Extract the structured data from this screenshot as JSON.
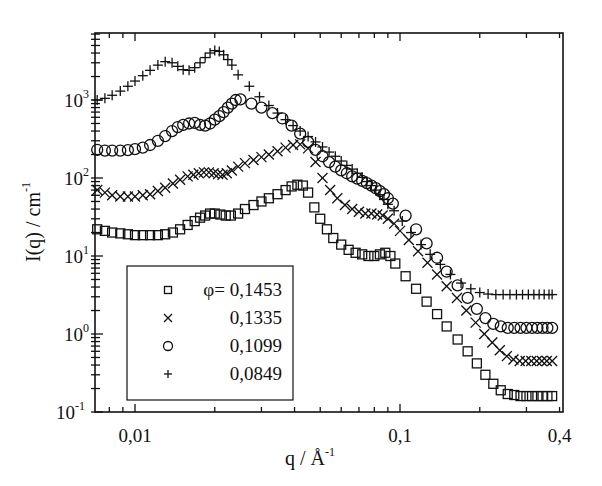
{
  "chart_data": {
    "type": "scatter",
    "title": "",
    "xlabel": "q / Å-1",
    "xlabel_parts": {
      "main": "q / Å",
      "sup": "-1"
    },
    "ylabel": "I(q) / cm-1",
    "ylabel_parts": {
      "main": "I(q) / cm",
      "sup": "-1"
    },
    "xscale": "log",
    "yscale": "log",
    "xlim": [
      0.0071,
      0.41
    ],
    "ylim": [
      0.1,
      6800
    ],
    "grid": false,
    "legend_position": "lower left (inside)",
    "x_ticks": [
      {
        "value": 0.01,
        "label": "0,01"
      },
      {
        "value": 0.1,
        "label": "0,1"
      },
      {
        "value": 0.4,
        "label": "0,4"
      }
    ],
    "y_ticks": [
      {
        "value": 0.1,
        "base": "10",
        "exp": "-1"
      },
      {
        "value": 1,
        "base": "10",
        "exp": "0"
      },
      {
        "value": 10,
        "base": "10",
        "exp": "1"
      },
      {
        "value": 100,
        "base": "10",
        "exp": "2"
      },
      {
        "value": 1000,
        "base": "10",
        "exp": "3"
      }
    ],
    "legend_title_prefix": "φ=",
    "series": [
      {
        "name": "0,1453",
        "marker": "square",
        "x": [
          0.0072,
          0.0077,
          0.0082,
          0.0088,
          0.0094,
          0.01,
          0.0107,
          0.0114,
          0.0122,
          0.013,
          0.0139,
          0.0148,
          0.0158,
          0.0168,
          0.0176,
          0.0184,
          0.0192,
          0.02,
          0.021,
          0.022,
          0.023,
          0.0245,
          0.026,
          0.028,
          0.03,
          0.032,
          0.0345,
          0.037,
          0.039,
          0.041,
          0.043,
          0.045,
          0.0475,
          0.05,
          0.053,
          0.056,
          0.06,
          0.064,
          0.068,
          0.072,
          0.076,
          0.08,
          0.084,
          0.088,
          0.092,
          0.096,
          0.105,
          0.115,
          0.126,
          0.138,
          0.15,
          0.165,
          0.18,
          0.195,
          0.21,
          0.225,
          0.24,
          0.255,
          0.27,
          0.285,
          0.3,
          0.315,
          0.33,
          0.345,
          0.36,
          0.375
        ],
        "y": [
          22,
          21,
          20,
          19.5,
          19,
          18.5,
          18.5,
          18.5,
          18.5,
          19,
          20,
          22,
          25,
          28,
          31,
          33,
          35,
          35,
          34,
          33,
          33,
          35,
          40,
          45,
          50,
          55,
          62,
          70,
          78,
          82,
          80,
          65,
          42,
          30,
          22,
          17,
          14,
          12,
          11,
          10.5,
          10,
          10,
          10.5,
          11,
          10,
          8,
          5.5,
          3.8,
          2.6,
          1.8,
          1.25,
          0.85,
          0.6,
          0.42,
          0.3,
          0.23,
          0.19,
          0.17,
          0.165,
          0.16,
          0.16,
          0.16,
          0.16,
          0.16,
          0.16,
          0.16
        ]
      },
      {
        "name": "0,1335",
        "marker": "x",
        "x": [
          0.0072,
          0.0077,
          0.0082,
          0.0088,
          0.0094,
          0.01,
          0.0107,
          0.0114,
          0.0122,
          0.013,
          0.0139,
          0.0148,
          0.0158,
          0.0166,
          0.0174,
          0.0182,
          0.019,
          0.0198,
          0.0206,
          0.0214,
          0.0222,
          0.0232,
          0.0245,
          0.026,
          0.028,
          0.03,
          0.032,
          0.0345,
          0.037,
          0.0395,
          0.042,
          0.045,
          0.048,
          0.051,
          0.0545,
          0.058,
          0.062,
          0.066,
          0.07,
          0.074,
          0.078,
          0.082,
          0.086,
          0.09,
          0.095,
          0.1,
          0.108,
          0.117,
          0.127,
          0.138,
          0.15,
          0.164,
          0.178,
          0.193,
          0.208,
          0.223,
          0.238,
          0.253,
          0.268,
          0.283,
          0.298,
          0.313,
          0.328,
          0.343,
          0.358,
          0.375
        ],
        "y": [
          70,
          65,
          60,
          58,
          58,
          58,
          60,
          62,
          68,
          75,
          85,
          95,
          105,
          110,
          115,
          118,
          118,
          115,
          112,
          110,
          115,
          125,
          140,
          155,
          170,
          185,
          200,
          220,
          245,
          265,
          270,
          240,
          160,
          100,
          70,
          55,
          45,
          40,
          37,
          35,
          35,
          34,
          33,
          30,
          26,
          21,
          16,
          11.5,
          8.2,
          5.8,
          4.1,
          2.9,
          2.0,
          1.4,
          1.0,
          0.78,
          0.62,
          0.52,
          0.47,
          0.45,
          0.45,
          0.45,
          0.45,
          0.45,
          0.45,
          0.45
        ]
      },
      {
        "name": "0,1099",
        "marker": "circle",
        "x": [
          0.0072,
          0.0077,
          0.0082,
          0.0088,
          0.0094,
          0.01,
          0.0107,
          0.0114,
          0.0122,
          0.013,
          0.0138,
          0.0145,
          0.0152,
          0.016,
          0.0168,
          0.0176,
          0.0184,
          0.0192,
          0.02,
          0.0208,
          0.0216,
          0.0224,
          0.0232,
          0.024,
          0.025,
          0.0275,
          0.03,
          0.033,
          0.036,
          0.039,
          0.042,
          0.045,
          0.048,
          0.051,
          0.054,
          0.057,
          0.06,
          0.063,
          0.066,
          0.069,
          0.072,
          0.075,
          0.078,
          0.081,
          0.084,
          0.087,
          0.09,
          0.094,
          0.105,
          0.115,
          0.126,
          0.138,
          0.15,
          0.165,
          0.18,
          0.195,
          0.21,
          0.225,
          0.24,
          0.255,
          0.27,
          0.285,
          0.3,
          0.315,
          0.33,
          0.345,
          0.36,
          0.375
        ],
        "y": [
          230,
          225,
          225,
          225,
          228,
          235,
          245,
          265,
          300,
          345,
          400,
          450,
          480,
          500,
          510,
          480,
          470,
          500,
          560,
          620,
          700,
          800,
          900,
          1000,
          1020,
          900,
          800,
          680,
          580,
          470,
          370,
          290,
          230,
          190,
          160,
          140,
          125,
          115,
          105,
          98,
          92,
          86,
          80,
          74,
          68,
          62,
          55,
          47,
          33,
          22,
          14.5,
          9.5,
          6.3,
          4.2,
          2.9,
          2.1,
          1.6,
          1.35,
          1.25,
          1.2,
          1.2,
          1.2,
          1.2,
          1.2,
          1.2,
          1.2,
          1.2,
          1.2
        ]
      },
      {
        "name": "0,0849",
        "marker": "plus",
        "x": [
          0.0072,
          0.0077,
          0.0082,
          0.0088,
          0.0094,
          0.01,
          0.0107,
          0.0114,
          0.0122,
          0.013,
          0.0138,
          0.0145,
          0.0152,
          0.016,
          0.0168,
          0.0176,
          0.0184,
          0.0192,
          0.02,
          0.0208,
          0.0216,
          0.0224,
          0.0232,
          0.0245,
          0.027,
          0.0295,
          0.032,
          0.0345,
          0.037,
          0.0395,
          0.042,
          0.045,
          0.048,
          0.051,
          0.054,
          0.057,
          0.06,
          0.063,
          0.066,
          0.069,
          0.072,
          0.075,
          0.078,
          0.081,
          0.084,
          0.087,
          0.09,
          0.095,
          0.102,
          0.11,
          0.12,
          0.13,
          0.142,
          0.155,
          0.17,
          0.185,
          0.2,
          0.215,
          0.23,
          0.245,
          0.26,
          0.275,
          0.29,
          0.305,
          0.32,
          0.335,
          0.35,
          0.365,
          0.375
        ],
        "y": [
          1000,
          1050,
          1150,
          1300,
          1500,
          1750,
          2050,
          2400,
          2800,
          3100,
          3000,
          2700,
          2450,
          2400,
          2600,
          3000,
          3500,
          4000,
          4300,
          4200,
          3800,
          3300,
          2800,
          2100,
          1500,
          1100,
          850,
          680,
          560,
          470,
          400,
          340,
          290,
          250,
          215,
          190,
          165,
          145,
          130,
          115,
          102,
          90,
          80,
          70,
          61,
          53,
          46,
          38,
          28,
          20,
          14,
          10.5,
          7.8,
          5.8,
          4.5,
          3.8,
          3.4,
          3.25,
          3.2,
          3.2,
          3.2,
          3.2,
          3.2,
          3.2,
          3.2,
          3.2,
          3.2,
          3.2,
          3.2
        ]
      }
    ]
  },
  "legend": {
    "items": [
      {
        "marker": "square",
        "label": "0,1453",
        "prefix": "φ= "
      },
      {
        "marker": "x",
        "label": "0,1335",
        "prefix": ""
      },
      {
        "marker": "circle",
        "label": "0,1099",
        "prefix": ""
      },
      {
        "marker": "plus",
        "label": "0,0849",
        "prefix": ""
      }
    ]
  },
  "colors": {
    "ink": "#111111",
    "background": "#ffffff"
  }
}
